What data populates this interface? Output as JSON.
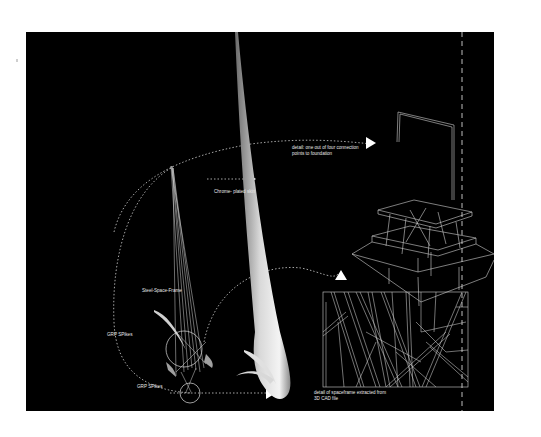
{
  "figure": {
    "background": "#000000",
    "page_background": "#ffffff",
    "line_color": "#e6e6e6"
  },
  "labels": {
    "chrome_skin": "Chrome- plated skin",
    "steel_frame": "Steel-Space-Frame",
    "grp_spikes_1": "GRP SPikes",
    "grp_spikes_2": "GRP SPikes",
    "connection_detail_line1": "detail: one out of four connection",
    "connection_detail_line2": "points to foundation",
    "spaceframe_detail_line1": "detail of spaceframe extracted from",
    "spaceframe_detail_line2": "3D CAD file"
  },
  "icons": {
    "arrow_chrome": "triangle-right",
    "arrow_connection": "triangle-right",
    "arrow_spaceframe": "triangle-up",
    "arrow_base": "triangle-right"
  }
}
